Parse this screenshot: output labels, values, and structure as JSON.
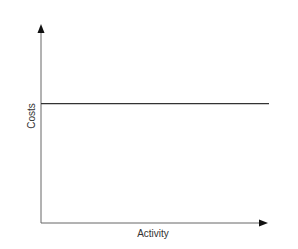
{
  "chart_data": {
    "type": "line",
    "title": "",
    "xlabel": "Activity",
    "ylabel": "Costs",
    "series": [
      {
        "name": "Fixed costs",
        "x": [
          0,
          1
        ],
        "values": [
          0.6,
          0.6
        ]
      }
    ],
    "xlim": [
      0,
      1
    ],
    "ylim": [
      0,
      1
    ],
    "grid": false,
    "legend": null,
    "ticks": "none",
    "annotations": []
  },
  "colors": {
    "axis": "#555555",
    "line": "#333333",
    "text": "#333333"
  }
}
